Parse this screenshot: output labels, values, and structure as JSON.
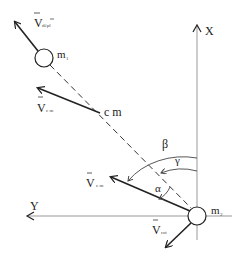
{
  "diagram": {
    "title": "",
    "colors": {
      "stroke": "#222222",
      "axis": "#999999",
      "background": "#ffffff"
    },
    "axes": {
      "x_label": "X",
      "y_label": "Y"
    },
    "bodies": [
      {
        "id": "m1",
        "label": "m",
        "sub": "1"
      },
      {
        "id": "m2",
        "label": "m",
        "sub": "2"
      }
    ],
    "center_of_mass": {
      "label": "c m"
    },
    "vectors": {
      "v_depl": {
        "label": "V",
        "sub": "dépl",
        "sup": "m"
      },
      "v_cm_upper": {
        "label": "V",
        "sub": "c m"
      },
      "v_cm_lower": {
        "label": "V",
        "sub": "c m"
      },
      "v_rot": {
        "label": "V",
        "sub": "rot"
      }
    },
    "angles": {
      "alpha": "α",
      "beta": "β",
      "gamma": "γ"
    }
  }
}
